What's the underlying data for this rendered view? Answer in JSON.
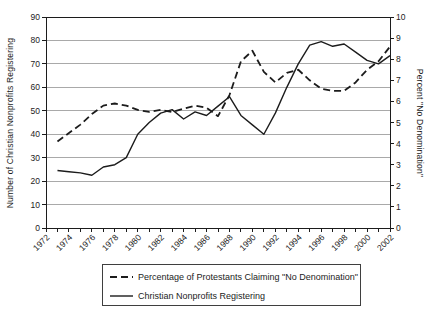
{
  "chart_data": {
    "type": "line",
    "title": "",
    "years": [
      1973,
      1974,
      1975,
      1976,
      1977,
      1978,
      1979,
      1980,
      1981,
      1982,
      1983,
      1984,
      1985,
      1986,
      1987,
      1988,
      1989,
      1990,
      1991,
      1992,
      1993,
      1994,
      1995,
      1996,
      1997,
      1998,
      1999,
      2000,
      2001,
      2002
    ],
    "series": [
      {
        "name": "Percentage of Protestants Claiming \"No Denomination\"",
        "axis": "right",
        "line_style": "dashed",
        "values": [
          4.1,
          4.5,
          4.9,
          5.4,
          5.8,
          5.9,
          5.8,
          5.6,
          5.5,
          5.6,
          5.5,
          5.65,
          5.8,
          5.7,
          5.3,
          6.3,
          7.9,
          8.4,
          7.4,
          6.9,
          7.35,
          7.5,
          7.0,
          6.6,
          6.5,
          6.5,
          6.9,
          7.5,
          7.9,
          8.6
        ]
      },
      {
        "name": "Christian Nonprofits Registering",
        "axis": "left",
        "line_style": "solid",
        "values": [
          24.5,
          24,
          23.5,
          22.5,
          26,
          27,
          30,
          40,
          45,
          49,
          50.5,
          46.5,
          49.5,
          48,
          52,
          56,
          48,
          44,
          40,
          49,
          60,
          70,
          78,
          79.5,
          77.5,
          78.5,
          75,
          71.5,
          70,
          73.5
        ]
      }
    ],
    "x_axis": {
      "min": 1972,
      "max": 2002,
      "tick_interval": 1,
      "label_interval": 2,
      "labels": [
        "1972",
        "1974",
        "1976",
        "1978",
        "1980",
        "1982",
        "1984",
        "1986",
        "1988",
        "1990",
        "1992",
        "1994",
        "1996",
        "1998",
        "2000",
        "2002"
      ]
    },
    "y_axis_left": {
      "label": "Number of Christian Nonprofits Registering",
      "min": 0,
      "max": 90,
      "tick_interval": 10,
      "ticks": [
        0,
        10,
        20,
        30,
        40,
        50,
        60,
        70,
        80,
        90
      ]
    },
    "y_axis_right": {
      "label": "Percent \"No Denomination\"",
      "min": 0,
      "max": 10,
      "tick_interval": 1,
      "ticks": [
        0,
        1,
        2,
        3,
        4,
        5,
        6,
        7,
        8,
        9,
        10
      ]
    },
    "gridlines": "horizontal",
    "legend": {
      "position": "bottom-center",
      "bordered": true,
      "entries": [
        "Percentage of Protestants Claiming \"No Denomination\"",
        "Christian Nonprofits Registering"
      ]
    },
    "colors": {
      "line": "#1c1c1c",
      "grid": "#a9a9a9",
      "background": "#ffffff"
    }
  }
}
